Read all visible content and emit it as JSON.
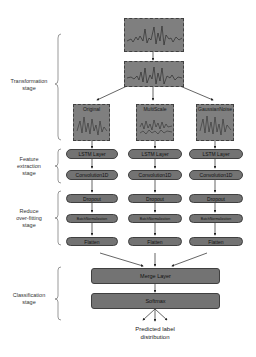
{
  "stages": [
    {
      "id": "transformation",
      "label_lines": [
        "Transformation",
        "stage"
      ]
    },
    {
      "id": "feature",
      "label_lines": [
        "Feature",
        "extraction",
        "stage"
      ]
    },
    {
      "id": "reduce",
      "label_lines": [
        "Reduce",
        "over-fitting",
        "stage"
      ]
    },
    {
      "id": "classification",
      "label_lines": [
        "Classification",
        "stage"
      ]
    }
  ],
  "inputs": {
    "raw_signal": "raw-signal-plot",
    "transformed_signal": "transformed-signal-plot"
  },
  "branches": [
    {
      "name": "Original",
      "lstm": "LSTM Layer",
      "conv": "Convolution1D",
      "dropout": "Dropout",
      "bn": "BatchNormalization",
      "flatten": "Flatten"
    },
    {
      "name": "MultiScale",
      "lstm": "LSTM Layer",
      "conv": "Convolution1D",
      "dropout": "Dropout",
      "bn": "BatchNormalization",
      "flatten": "Flatten"
    },
    {
      "name": "GaussianNoise",
      "lstm": "LSTM Layer",
      "conv": "Convolution1D",
      "dropout": "Dropout",
      "bn": "BatchNormalization",
      "flatten": "Flatten"
    }
  ],
  "merge": "Merge Layer",
  "softmax": "Softmax",
  "output_lines": [
    "Predicted label",
    "distribution"
  ],
  "colors": {
    "box_fill": "#737373",
    "signal_fill": "#7f7f7f",
    "border": "#404040",
    "line": "#222222"
  }
}
